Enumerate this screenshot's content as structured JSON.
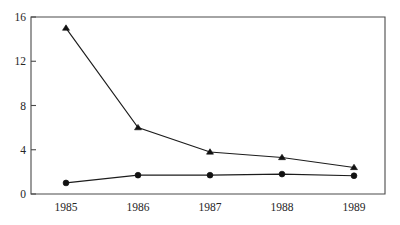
{
  "chart_data": {
    "type": "line",
    "title": "",
    "subtitle": "",
    "xlabel": "",
    "ylabel": "",
    "categories": [
      "1985",
      "1986",
      "1987",
      "1988",
      "1989"
    ],
    "x": [
      1985,
      1986,
      1987,
      1988,
      1989
    ],
    "series": [
      {
        "name": "series-triangle",
        "marker": "triangle",
        "values": [
          15.0,
          6.0,
          3.8,
          3.3,
          2.4
        ]
      },
      {
        "name": "series-circle",
        "marker": "circle",
        "values": [
          1.0,
          1.7,
          1.7,
          1.8,
          1.65
        ]
      }
    ],
    "ylim": [
      0,
      16
    ],
    "yticks": [
      0,
      4,
      8,
      12,
      16
    ],
    "ytick_labels": [
      "0",
      "4",
      "8",
      "12",
      "16"
    ],
    "xtick_labels": [
      "1985",
      "1986",
      "1987",
      "1988",
      "1989"
    ],
    "grid": false,
    "legend": null,
    "legend_position": "none",
    "annotations": [],
    "colors": {
      "line": "#1c1c1c",
      "marker": "#111111",
      "axis": "#4a4a4a",
      "text": "#262626",
      "background": "#ffffff"
    }
  },
  "axes": {
    "y_tick_0": "0",
    "y_tick_1": "4",
    "y_tick_2": "8",
    "y_tick_3": "12",
    "y_tick_4": "16",
    "x_tick_0": "1985",
    "x_tick_1": "1986",
    "x_tick_2": "1987",
    "x_tick_3": "1988",
    "x_tick_4": "1989"
  }
}
